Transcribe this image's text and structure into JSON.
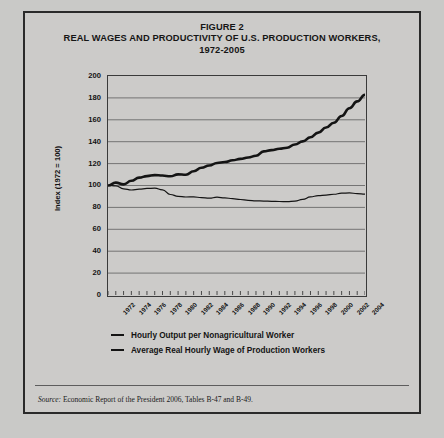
{
  "figure": {
    "title_line1": "FIGURE 2",
    "title_line2": "REAL WAGES AND PRODUCTIVITY OF U.S. PRODUCTION WORKERS,",
    "title_line3": "1972-2005",
    "source_prefix": "Source:",
    "source_text": "Economic Report of the President 2006, Tables B-47 and B-49."
  },
  "colors": {
    "card_background": "#cccbc9",
    "page_background": "#c9c9c7",
    "border": "#2a2a2a",
    "line": "#141414",
    "gridline": "#6a6a6a"
  },
  "chart_data": {
    "type": "line",
    "title": "REAL WAGES AND PRODUCTIVITY OF U.S. PRODUCTION WORKERS, 1972-2005",
    "xlabel": "",
    "ylabel": "Index (1972 = 100)",
    "ylim": [
      0,
      200
    ],
    "xlim": [
      1972,
      2005
    ],
    "grid": true,
    "legend_position": "bottom",
    "yticks": [
      200,
      180,
      160,
      140,
      120,
      100,
      80,
      60,
      40,
      20,
      0
    ],
    "xticks": [
      1972,
      1974,
      1976,
      1978,
      1980,
      1982,
      1984,
      1986,
      1988,
      1990,
      1992,
      1994,
      1996,
      1998,
      2000,
      2002,
      2004
    ],
    "x": [
      1972,
      1973,
      1974,
      1975,
      1976,
      1977,
      1978,
      1979,
      1980,
      1981,
      1982,
      1983,
      1984,
      1985,
      1986,
      1987,
      1988,
      1989,
      1990,
      1991,
      1992,
      1993,
      1994,
      1995,
      1996,
      1997,
      1998,
      1999,
      2000,
      2001,
      2002,
      2003,
      2004,
      2005
    ],
    "series": [
      {
        "name": "Hourly Output per Nonagricultural Worker",
        "style": "thick",
        "values": [
          100.0,
          102.6,
          101.0,
          104.3,
          107.2,
          108.6,
          109.5,
          109.1,
          108.4,
          110.2,
          109.8,
          113.0,
          116.2,
          118.2,
          120.6,
          121.4,
          123.0,
          124.3,
          125.6,
          127.2,
          131.2,
          132.3,
          133.6,
          134.5,
          137.5,
          140.3,
          144.1,
          148.3,
          152.9,
          157.3,
          163.5,
          170.6,
          176.8,
          182.9
        ]
      },
      {
        "name": "Average Real Hourly Wage of Production Workers",
        "style": "thin",
        "values": [
          100.0,
          99.7,
          97.0,
          95.9,
          96.6,
          97.3,
          97.6,
          96.0,
          91.8,
          90.1,
          89.5,
          89.6,
          89.0,
          88.4,
          89.3,
          88.7,
          88.0,
          87.2,
          86.4,
          86.0,
          85.8,
          85.5,
          85.4,
          85.3,
          85.7,
          87.3,
          89.6,
          90.7,
          91.3,
          92.0,
          93.0,
          93.2,
          92.6,
          92.2
        ]
      }
    ],
    "legend": [
      "Hourly Output per Nonagricultural Worker",
      "Average Real Hourly Wage of Production Workers"
    ]
  }
}
